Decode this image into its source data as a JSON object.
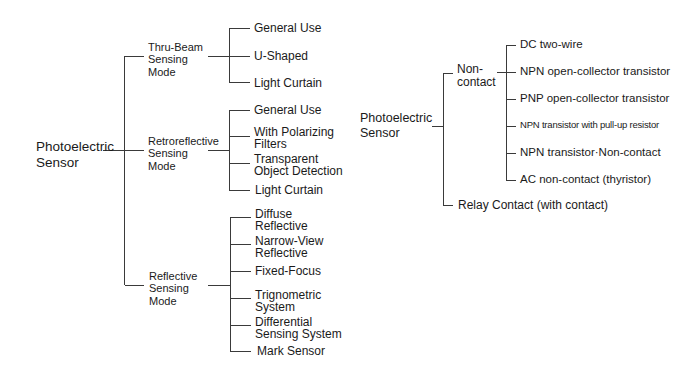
{
  "left_tree": {
    "root": "Photoelectric\nSensor",
    "modes": [
      {
        "label": "Thru-Beam\nSensing\nMode",
        "children": [
          "General Use",
          "U-Shaped",
          "Light Curtain"
        ]
      },
      {
        "label": "Retroreflective\nSensing\nMode",
        "children": [
          "General Use",
          "With Polarizing\nFilters",
          "Transparent\nObject Detection",
          "Light Curtain"
        ]
      },
      {
        "label": "Reflective\nSensing\nMode",
        "children": [
          "Diffuse\nReflective",
          "Narrow-View\nReflective",
          "Fixed-Focus",
          "Trignometric\nSystem",
          "Differential\nSensing System",
          "Mark Sensor"
        ]
      }
    ]
  },
  "right_tree": {
    "root": "Photoelectric\nSensor",
    "branches": [
      {
        "label": "Non-\ncontact",
        "children": [
          "DC two-wire",
          "NPN open-collector transistor",
          "PNP open-collector transistor",
          "NPN transistor with pull-up resistor",
          "NPN transistor·Non-contact",
          "AC non-contact (thyristor)"
        ]
      },
      {
        "label": "Relay Contact (with contact)"
      }
    ]
  },
  "colors": {
    "line": "#3a3a3a",
    "text": "#1a1a1a",
    "background": "#ffffff"
  }
}
